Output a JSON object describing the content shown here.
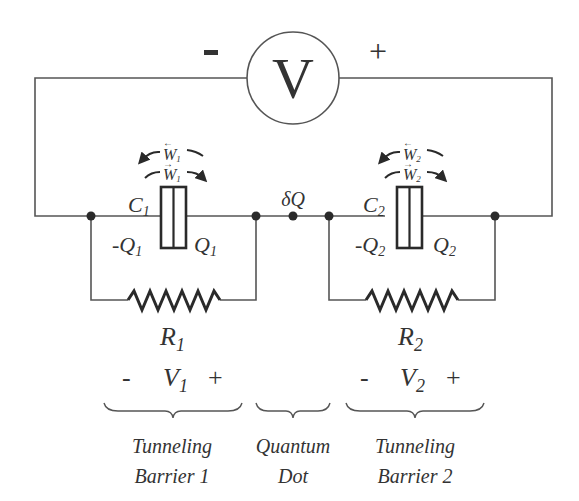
{
  "diagram": {
    "source": {
      "symbol": "V",
      "minus": "-",
      "plus": "+"
    },
    "junction1": {
      "capacitor": "C",
      "capacitor_sub": "1",
      "charge_left": "-Q",
      "charge_left_sub": "1",
      "charge_right": "Q",
      "charge_right_sub": "1",
      "work_back": "W",
      "work_back_sub": "1",
      "work_fwd": "W",
      "work_fwd_sub": "1",
      "resistor": "R",
      "resistor_sub": "1",
      "voltage": "V",
      "voltage_sub": "1",
      "v_minus": "-",
      "v_plus": "+"
    },
    "junction2": {
      "capacitor": "C",
      "capacitor_sub": "2",
      "charge_left": "-Q",
      "charge_left_sub": "2",
      "charge_right": "Q",
      "charge_right_sub": "2",
      "work_back": "W",
      "work_back_sub": "2",
      "work_fwd": "W",
      "work_fwd_sub": "2",
      "resistor": "R",
      "resistor_sub": "2",
      "voltage": "V",
      "voltage_sub": "2",
      "v_minus": "-",
      "v_plus": "+"
    },
    "dot_charge": "δQ",
    "regions": [
      {
        "line1": "Tunneling",
        "line2": "Barrier 1"
      },
      {
        "line1": "Quantum",
        "line2": "Dot"
      },
      {
        "line1": "Tunneling",
        "line2": "Barrier 2"
      }
    ],
    "colors": {
      "wire": "#555555",
      "component": "#2a2a2a",
      "text": "#333333"
    }
  }
}
